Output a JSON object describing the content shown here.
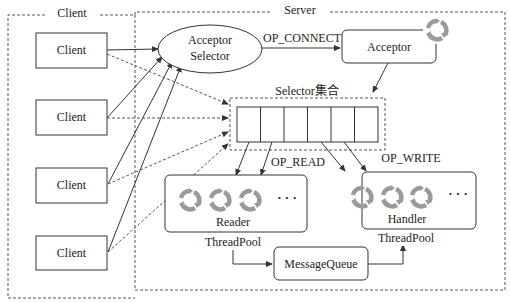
{
  "frames": {
    "client_label": "Client",
    "server_label": "Server"
  },
  "clients": [
    {
      "label": "Client"
    },
    {
      "label": "Client"
    },
    {
      "label": "Client"
    },
    {
      "label": "Client"
    }
  ],
  "acceptor_selector": {
    "line1": "Acceptor",
    "line2": "Selector"
  },
  "op_connect": "OP_CONNECT",
  "acceptor": {
    "label": "Acceptor",
    "icon": "refresh-cycle-icon"
  },
  "selector_set": {
    "label": "Selector集合",
    "cells": 6
  },
  "op_read": "OP_READ",
  "op_write": "OP_WRITE",
  "reader_pool": {
    "line1": "Reader",
    "line2": "ThreadPool",
    "ellipsis": "· · ·",
    "icon": "refresh-cycle-icon",
    "icon_count": 3
  },
  "handler_pool": {
    "line1": "Handler",
    "line2": "ThreadPool",
    "ellipsis": "· · ·",
    "icon": "refresh-cycle-icon",
    "icon_count": 3
  },
  "message_queue": {
    "label": "MessageQueue"
  },
  "colors": {
    "line": "#333333",
    "dashed": "#555555",
    "icon": "#9a9a9a"
  }
}
